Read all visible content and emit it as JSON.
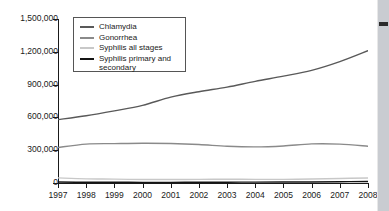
{
  "chart_data": {
    "type": "line",
    "title": "",
    "xlabel": "",
    "ylabel": "",
    "x": [
      1997,
      1998,
      1999,
      2000,
      2001,
      2002,
      2003,
      2004,
      2005,
      2006,
      2007,
      2008
    ],
    "xtick_labels": [
      "1997",
      "1998",
      "1999",
      "2000",
      "2001",
      "2002",
      "2003",
      "2004",
      "2005",
      "2006",
      "2007",
      "2008"
    ],
    "ytick_labels": [
      "1,500,000",
      "1,200,000",
      "900,000",
      "600,000",
      "300,000",
      "0"
    ],
    "ytick_values": [
      1500000,
      1200000,
      900000,
      600000,
      300000,
      0
    ],
    "ylim": [
      0,
      1500000
    ],
    "xlim": [
      1997,
      2008
    ],
    "grid": false,
    "legend_position": "upper-left-inside",
    "series": [
      {
        "name": "Chlamydia",
        "color": "#595959",
        "values": [
          580000,
          615000,
          660000,
          710000,
          785000,
          835000,
          877000,
          930000,
          977000,
          1030000,
          1110000,
          1210000
        ]
      },
      {
        "name": "Gonorrhea",
        "color": "#8a8a8a",
        "values": [
          325000,
          356000,
          360000,
          363000,
          361000,
          352000,
          336000,
          330000,
          339000,
          358000,
          356000,
          336000
        ]
      },
      {
        "name": "Syphilis all stages",
        "color": "#c8c8c8",
        "values": [
          46500,
          38000,
          35600,
          31600,
          32200,
          32900,
          34300,
          33400,
          33300,
          36900,
          40900,
          46300
        ]
      },
      {
        "name": "Syphilis primary and secondary",
        "color": "#141414",
        "values": [
          8550,
          7000,
          6660,
          5980,
          6100,
          6860,
          7180,
          7980,
          8720,
          9760,
          11470,
          13500
        ]
      }
    ]
  },
  "legend": {
    "items": [
      {
        "label": "Chlamydia"
      },
      {
        "label": "Gonorrhea"
      },
      {
        "label": "Syphilis all stages"
      },
      {
        "label": "Syphilis primary and secondary"
      }
    ]
  }
}
